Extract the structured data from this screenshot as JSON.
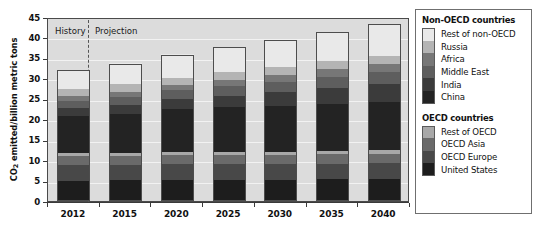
{
  "chart_data": {
    "type": "bar",
    "subtype": "stacked-bar",
    "title": "",
    "xlabel": "",
    "ylabel": "CO2 emitted/billion metric tons",
    "ylabel_parts": {
      "prefix": "CO",
      "subscript": "2",
      "suffix": " emitted/billion metric tons"
    },
    "categories": [
      "2012",
      "2015",
      "2020",
      "2025",
      "2030",
      "2035",
      "2040"
    ],
    "ylim": [
      0,
      45
    ],
    "yticks": [
      0,
      5,
      10,
      15,
      20,
      25,
      30,
      35,
      40,
      45
    ],
    "grid": true,
    "legend_position": "right",
    "annotations": [
      {
        "text": "History",
        "x_region": "2012"
      },
      {
        "text": "Projection",
        "x_region": "2015-2040"
      },
      {
        "type": "dashed-divider",
        "between": [
          "2012",
          "2015"
        ]
      }
    ],
    "stack_order_bottom_to_top": [
      "United States",
      "OECD Europe",
      "OECD Asia",
      "Rest of OECD",
      "China",
      "India",
      "Middle East",
      "Africa",
      "Russia",
      "Rest of non-OECD"
    ],
    "totals": [
      32.0,
      33.5,
      35.7,
      37.6,
      39.3,
      41.3,
      43.2
    ],
    "series": [
      {
        "name": "United States",
        "group": "OECD",
        "color": "#1d1d1d",
        "pattern": "speck",
        "values": [
          5.0,
          5.1,
          5.2,
          5.2,
          5.2,
          5.3,
          5.4
        ]
      },
      {
        "name": "OECD Europe",
        "group": "OECD",
        "color": "#484848",
        "pattern": "solid",
        "values": [
          3.9,
          3.8,
          3.8,
          3.8,
          3.8,
          3.8,
          3.9
        ]
      },
      {
        "name": "OECD Asia",
        "group": "OECD",
        "color": "#6a6a6a",
        "pattern": "solid",
        "values": [
          2.2,
          2.2,
          2.2,
          2.2,
          2.3,
          2.3,
          2.3
        ]
      },
      {
        "name": "Rest of OECD",
        "group": "OECD",
        "color": "#a8a8a8",
        "pattern": "solid",
        "values": [
          0.7,
          0.7,
          0.8,
          0.8,
          0.8,
          0.9,
          0.9
        ]
      },
      {
        "name": "China",
        "group": "Non-OECD",
        "color": "#232323",
        "pattern": "speck",
        "values": [
          9.0,
          9.6,
          10.4,
          10.9,
          11.1,
          11.4,
          11.6
        ]
      },
      {
        "name": "India",
        "group": "Non-OECD",
        "color": "#3b3b3b",
        "pattern": "solid",
        "values": [
          1.9,
          2.1,
          2.5,
          2.9,
          3.4,
          3.9,
          4.4
        ]
      },
      {
        "name": "Middle East",
        "group": "Non-OECD",
        "color": "#5e5e5e",
        "pattern": "hatch",
        "values": [
          1.8,
          2.0,
          2.2,
          2.4,
          2.6,
          2.8,
          3.0
        ]
      },
      {
        "name": "Africa",
        "group": "Non-OECD",
        "color": "#777777",
        "pattern": "solid",
        "values": [
          1.1,
          1.2,
          1.3,
          1.5,
          1.6,
          1.8,
          2.0
        ]
      },
      {
        "name": "Russia",
        "group": "Non-OECD",
        "color": "#b4b4b4",
        "pattern": "solid",
        "values": [
          1.8,
          1.8,
          1.8,
          1.9,
          1.9,
          2.0,
          2.0
        ]
      },
      {
        "name": "Rest of non-OECD",
        "group": "Non-OECD",
        "color": "#e9e9e9",
        "pattern": "solid",
        "values": [
          4.6,
          5.0,
          5.5,
          6.0,
          6.6,
          7.1,
          7.7
        ]
      }
    ]
  },
  "legend": {
    "groups": [
      {
        "title": "Non-OECD countries",
        "items": [
          {
            "label": "Rest of non-OECD",
            "color": "#e9e9e9",
            "pattern": "solid"
          },
          {
            "label": "Russia",
            "color": "#b4b4b4",
            "pattern": "solid"
          },
          {
            "label": "Africa",
            "color": "#777777",
            "pattern": "solid"
          },
          {
            "label": "Middle East",
            "color": "#5e5e5e",
            "pattern": "hatch"
          },
          {
            "label": "India",
            "color": "#3b3b3b",
            "pattern": "solid"
          },
          {
            "label": "China",
            "color": "#232323",
            "pattern": "speck"
          }
        ]
      },
      {
        "title": "OECD countries",
        "items": [
          {
            "label": "Rest of OECD",
            "color": "#a8a8a8",
            "pattern": "solid"
          },
          {
            "label": "OECD Asia",
            "color": "#6a6a6a",
            "pattern": "solid"
          },
          {
            "label": "OECD Europe",
            "color": "#484848",
            "pattern": "solid"
          },
          {
            "label": "United States",
            "color": "#1d1d1d",
            "pattern": "speck"
          }
        ]
      }
    ]
  },
  "colors": {
    "plot_background": "#dcdcdc",
    "gridline": "#f2f2f2",
    "axis": "#3a3a3a",
    "bar_outline": "#4d4d4d",
    "divider": "#555555"
  }
}
